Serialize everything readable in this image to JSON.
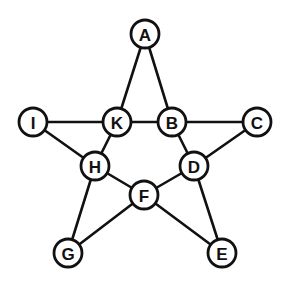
{
  "diagram": {
    "type": "graph",
    "shape": "pentagram",
    "node_radius": 14,
    "colors": {
      "stroke": "#111111",
      "fill": "#ffffff",
      "background": "#ffffff"
    },
    "nodes": [
      {
        "id": "A",
        "label": "A",
        "x": 145,
        "y": 34
      },
      {
        "id": "I",
        "label": "I",
        "x": 33,
        "y": 122
      },
      {
        "id": "K",
        "label": "K",
        "x": 117,
        "y": 122
      },
      {
        "id": "B",
        "label": "B",
        "x": 172,
        "y": 122
      },
      {
        "id": "C",
        "label": "C",
        "x": 257,
        "y": 122
      },
      {
        "id": "H",
        "label": "H",
        "x": 95,
        "y": 166
      },
      {
        "id": "D",
        "label": "D",
        "x": 194,
        "y": 166
      },
      {
        "id": "F",
        "label": "F",
        "x": 144,
        "y": 195
      },
      {
        "id": "G",
        "label": "G",
        "x": 68,
        "y": 253
      },
      {
        "id": "E",
        "label": "E",
        "x": 222,
        "y": 253
      }
    ],
    "edges": [
      [
        "A",
        "K"
      ],
      [
        "A",
        "B"
      ],
      [
        "I",
        "K"
      ],
      [
        "K",
        "B"
      ],
      [
        "B",
        "C"
      ],
      [
        "I",
        "H"
      ],
      [
        "K",
        "H"
      ],
      [
        "B",
        "D"
      ],
      [
        "C",
        "D"
      ],
      [
        "H",
        "F"
      ],
      [
        "D",
        "F"
      ],
      [
        "H",
        "G"
      ],
      [
        "G",
        "F"
      ],
      [
        "F",
        "E"
      ],
      [
        "D",
        "E"
      ]
    ]
  }
}
